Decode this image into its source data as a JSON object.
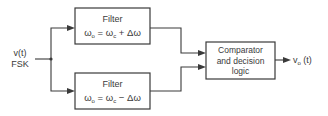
{
  "diagram": {
    "type": "block-diagram",
    "input": {
      "signal": "v(t)",
      "modulation": "FSK"
    },
    "filter_upper": {
      "title": "Filter",
      "eq_lhs": "ω",
      "eq_lhs_sub": "o",
      "eq_mid": " = ω",
      "eq_mid_sub": "c",
      "eq_rhs": " + Δω"
    },
    "filter_lower": {
      "title": "Filter",
      "eq_lhs": "ω",
      "eq_lhs_sub": "o",
      "eq_mid": " = ω",
      "eq_mid_sub": "c",
      "eq_rhs": " − Δω"
    },
    "comparator": {
      "line1": "Comparator",
      "line2": "and decision",
      "line3": "logic"
    },
    "output": {
      "signal_prefix": "v",
      "signal_sub": "o",
      "signal_suffix": " (t)"
    },
    "colors": {
      "stroke": "#3a3a3a",
      "background": "#ffffff"
    }
  }
}
